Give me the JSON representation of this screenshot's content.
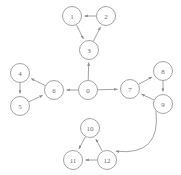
{
  "diagram": {
    "type": "node-link-diagram",
    "background_color": "#ffffff",
    "node_fill_color": "#ffffff",
    "node_stroke_color": "#8c8c8c",
    "node_label_color": "#6e6e6e",
    "edge_color": "#8c8c8c",
    "node_radius": 9.5,
    "nodes": [
      {
        "id": "0",
        "label": "0",
        "x": 88,
        "y": 90
      },
      {
        "id": "1",
        "label": "1",
        "x": 72,
        "y": 16
      },
      {
        "id": "2",
        "label": "2",
        "x": 106,
        "y": 16
      },
      {
        "id": "3",
        "label": "3",
        "x": 89,
        "y": 50
      },
      {
        "id": "4",
        "label": "4",
        "x": 20,
        "y": 73
      },
      {
        "id": "5",
        "label": "5",
        "x": 20,
        "y": 106
      },
      {
        "id": "6",
        "label": "6",
        "x": 54,
        "y": 90
      },
      {
        "id": "7",
        "label": "7",
        "x": 130,
        "y": 89
      },
      {
        "id": "8",
        "label": "8",
        "x": 163,
        "y": 71
      },
      {
        "id": "9",
        "label": "9",
        "x": 163,
        "y": 104
      },
      {
        "id": "10",
        "label": "10",
        "x": 90,
        "y": 128
      },
      {
        "id": "11",
        "label": "11",
        "x": 73,
        "y": 160
      },
      {
        "id": "12",
        "label": "12",
        "x": 107,
        "y": 160
      }
    ],
    "edges": [
      {
        "from": "0",
        "to": "3",
        "curved": false
      },
      {
        "from": "0",
        "to": "6",
        "curved": false
      },
      {
        "from": "0",
        "to": "7",
        "curved": false
      },
      {
        "from": "2",
        "to": "1",
        "curved": false
      },
      {
        "from": "1",
        "to": "3",
        "curved": false
      },
      {
        "from": "3",
        "to": "2",
        "curved": false
      },
      {
        "from": "6",
        "to": "4",
        "curved": false
      },
      {
        "from": "4",
        "to": "5",
        "curved": false
      },
      {
        "from": "5",
        "to": "6",
        "curved": false
      },
      {
        "from": "7",
        "to": "8",
        "curved": false
      },
      {
        "from": "8",
        "to": "9",
        "curved": false
      },
      {
        "from": "9",
        "to": "7",
        "curved": false
      },
      {
        "from": "10",
        "to": "11",
        "curved": false
      },
      {
        "from": "12",
        "to": "10",
        "curved": false
      },
      {
        "from": "12",
        "to": "11",
        "curved": false
      },
      {
        "from": "9",
        "to": "12",
        "curved": true,
        "curvature": 0.45
      }
    ]
  }
}
